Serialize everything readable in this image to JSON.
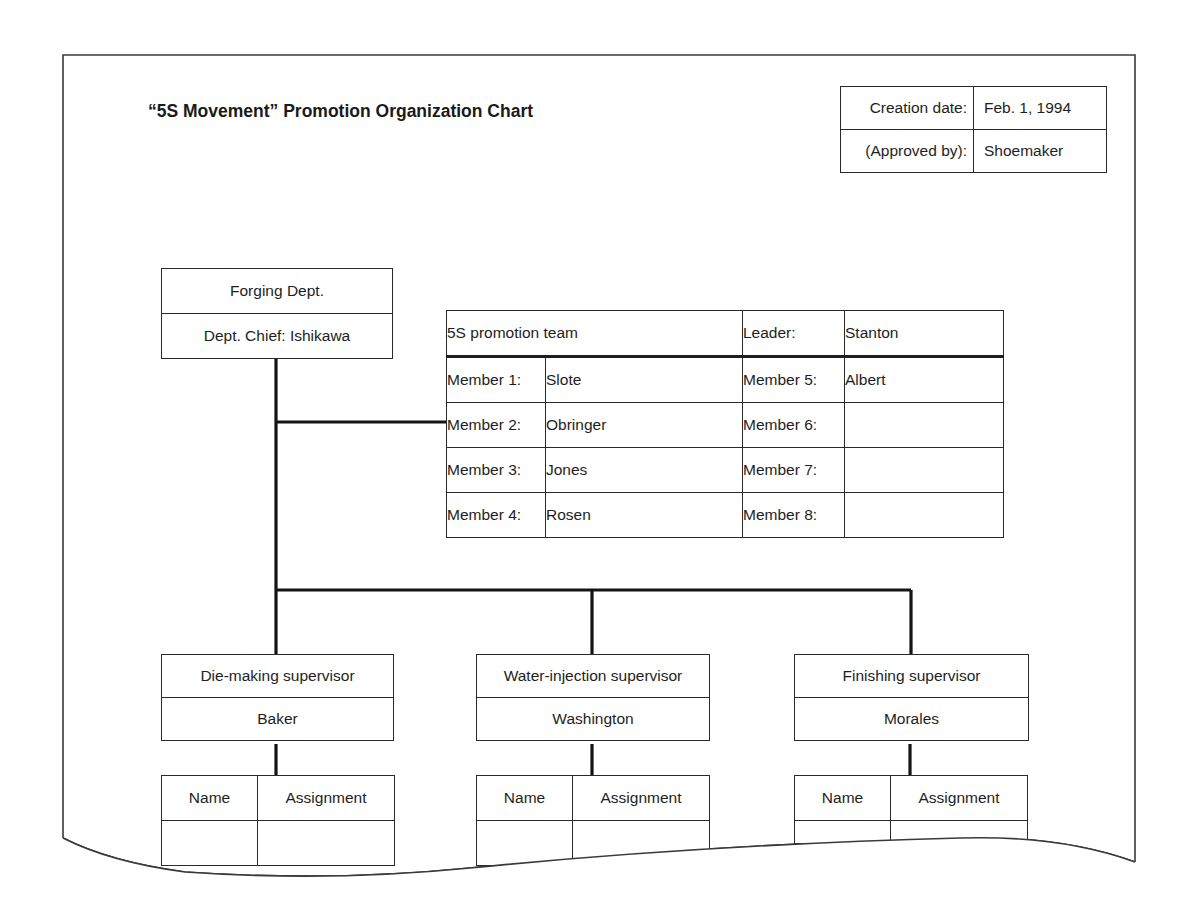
{
  "title": "“5S Movement” Promotion Organization Chart",
  "meta": {
    "creation_date_label": "Creation date:",
    "creation_date_value": "Feb. 1, 1994",
    "approved_by_label": "(Approved by):",
    "approved_by_value": "Shoemaker"
  },
  "department": {
    "name": "Forging Dept.",
    "chief": "Dept. Chief:  Ishikawa"
  },
  "team": {
    "title": "5S promotion team",
    "leader_label": "Leader:",
    "leader_value": "Stanton",
    "members": [
      {
        "label": "Member 1:",
        "name": "Slote"
      },
      {
        "label": "Member 2:",
        "name": "Obringer"
      },
      {
        "label": "Member 3:",
        "name": "Jones"
      },
      {
        "label": "Member 4:",
        "name": "Rosen"
      },
      {
        "label": "Member 5:",
        "name": "Albert"
      },
      {
        "label": "Member 6:",
        "name": ""
      },
      {
        "label": "Member 7:",
        "name": ""
      },
      {
        "label": "Member 8:",
        "name": ""
      }
    ]
  },
  "supervisors": [
    {
      "role": "Die-making supervisor",
      "name": "Baker",
      "col_name": "Name",
      "col_assignment": "Assignment"
    },
    {
      "role": "Water-injection supervisor",
      "name": "Washington",
      "col_name": "Name",
      "col_assignment": "Assignment"
    },
    {
      "role": "Finishing supervisor",
      "name": "Morales",
      "col_name": "Name",
      "col_assignment": "Assignment"
    }
  ]
}
